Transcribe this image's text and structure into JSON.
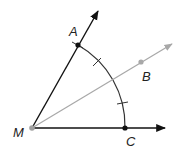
{
  "diagram": {
    "type": "geometry-angle-bisector",
    "colors": {
      "ray": "#111111",
      "bisector": "#a8a8a8",
      "arc": "#333333",
      "point": "#111111",
      "vertex": "#a0a0a0"
    },
    "points": {
      "M": {
        "label": "M",
        "x": 32,
        "y": 128
      },
      "A": {
        "label": "A",
        "x": 78,
        "y": 45
      },
      "B": {
        "label": "B",
        "x": 141,
        "y": 62
      },
      "C": {
        "label": "C",
        "x": 125,
        "y": 128
      }
    },
    "rays": [
      {
        "name": "MA",
        "from": "M",
        "through": "A"
      },
      {
        "name": "MB",
        "from": "M",
        "through": "B",
        "style": "gray"
      },
      {
        "name": "MC",
        "from": "M",
        "through": "C"
      }
    ],
    "arc": {
      "center": "M",
      "from": "A",
      "to": "C",
      "tick_marks": 2
    },
    "labels": {
      "A": "A",
      "B": "B",
      "C": "C",
      "M": "M"
    }
  }
}
